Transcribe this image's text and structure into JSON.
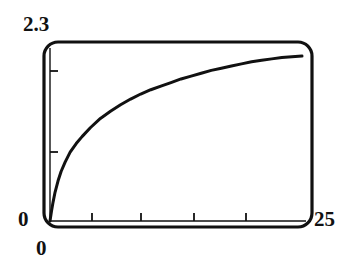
{
  "figure": {
    "background_color": "#ffffff",
    "ink_color": "#111111"
  },
  "labels": {
    "y_max": "2.3",
    "y_min": "0",
    "x_min": "0",
    "x_max": "25"
  },
  "chart_data": {
    "type": "line",
    "title": "",
    "subtitle": "",
    "xlabel": "",
    "ylabel": "",
    "xlim": [
      0,
      25
    ],
    "ylim": [
      0,
      2.3
    ],
    "grid": false,
    "legend": null,
    "legend_position": "none",
    "frame": {
      "style": "rounded-rectangle",
      "corner_radius_px": 14,
      "stroke_color": "#111111",
      "stroke_width_px": 3.2,
      "left_px": 44,
      "right_px": 312,
      "top_px": 42,
      "bottom_px": 227
    },
    "x_tick_labels": [
      "0",
      "25"
    ],
    "y_tick_labels": [
      "0",
      "2.3"
    ],
    "x_ticks_values": [
      5,
      10,
      15,
      20
    ],
    "y_ticks_values": [
      1,
      2
    ],
    "x_tick_pixels": [
      92,
      141,
      194,
      246
    ],
    "y_tick_pixels": [
      152,
      71
    ],
    "tick_length_px": 8,
    "series": [
      {
        "name": "curve",
        "color": "#111111",
        "line_width_px": 3.0,
        "shape": "logarithmic",
        "x": [
          0.0,
          0.15,
          0.3,
          0.5,
          0.8,
          1.1,
          1.5,
          2.0,
          2.6,
          3.2,
          4.0,
          5.0,
          6.0,
          7.0,
          8.0,
          9.0,
          10.0,
          11.0,
          12.0,
          13.0,
          14.0,
          15.0,
          16.0,
          17.0,
          18.0,
          19.0,
          20.0,
          21.0,
          22.0,
          23.0,
          24.0,
          25.0
        ],
        "y": [
          0.0,
          0.14,
          0.26,
          0.4,
          0.56,
          0.69,
          0.82,
          0.96,
          1.08,
          1.18,
          1.3,
          1.43,
          1.53,
          1.62,
          1.7,
          1.77,
          1.83,
          1.88,
          1.93,
          1.98,
          2.02,
          2.06,
          2.1,
          2.13,
          2.16,
          2.19,
          2.22,
          2.24,
          2.26,
          2.28,
          2.29,
          2.3
        ]
      }
    ]
  }
}
